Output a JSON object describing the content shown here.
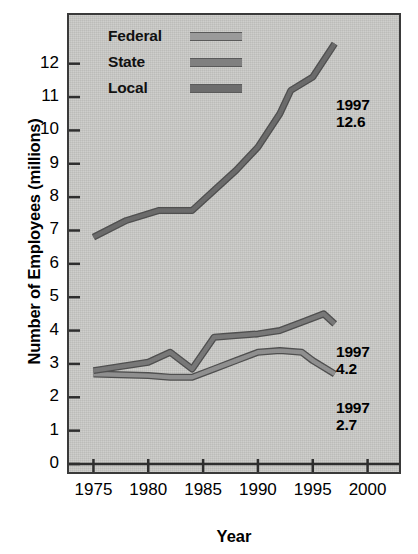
{
  "chart_data": {
    "type": "line",
    "title": "",
    "xlabel": "Year",
    "ylabel": "Number of Employees (millions)",
    "xlim": [
      1973.5,
      2002.5
    ],
    "ylim": [
      0,
      13.1
    ],
    "grid": false,
    "legend_position": "top-left-inside",
    "x_ticks": [
      "1975",
      "1980",
      "1985",
      "1990",
      "1995",
      "2000"
    ],
    "x_tick_values": [
      1975,
      1980,
      1985,
      1990,
      1995,
      2000
    ],
    "y_ticks": [
      "0",
      "1",
      "2",
      "3",
      "4",
      "5",
      "6",
      "7",
      "8",
      "9",
      "10",
      "11",
      "12"
    ],
    "y_tick_values": [
      0,
      1,
      2,
      3,
      4,
      5,
      6,
      7,
      8,
      9,
      10,
      11,
      12
    ],
    "series": [
      {
        "name": "Federal",
        "color": "#8f8f8f",
        "x": [
          1975,
          1980,
          1982,
          1984,
          1986,
          1988,
          1990,
          1992,
          1994,
          1995,
          1997
        ],
        "values": [
          2.7,
          2.65,
          2.6,
          2.6,
          2.85,
          3.1,
          3.35,
          3.4,
          3.35,
          3.1,
          2.7
        ]
      },
      {
        "name": "State",
        "color": "#787878",
        "x": [
          1975,
          1980,
          1982,
          1984,
          1986,
          1988,
          1990,
          1992,
          1994,
          1996,
          1997
        ],
        "values": [
          2.8,
          3.05,
          3.35,
          2.85,
          3.8,
          3.85,
          3.9,
          4.0,
          4.25,
          4.5,
          4.2
        ]
      },
      {
        "name": "Local",
        "color": "#6b6b6b",
        "x": [
          1975,
          1978,
          1981,
          1984,
          1986,
          1988,
          1990,
          1992,
          1993,
          1995,
          1997
        ],
        "values": [
          6.8,
          7.3,
          7.6,
          7.6,
          8.2,
          8.8,
          9.5,
          10.5,
          11.2,
          11.6,
          12.6
        ]
      }
    ],
    "annotations": [
      {
        "id": "local-end",
        "year": "1997",
        "value": "12.6",
        "series": "Local"
      },
      {
        "id": "state-end",
        "year": "1997",
        "value": "4.2",
        "series": "State"
      },
      {
        "id": "federal-end",
        "year": "1997",
        "value": "2.7",
        "series": "Federal"
      }
    ]
  },
  "legend": {
    "items": [
      {
        "label": "Federal",
        "color": "#9a9a9a"
      },
      {
        "label": "State",
        "color": "#808080"
      },
      {
        "label": "Local",
        "color": "#6d6d6d"
      }
    ]
  },
  "axes": {
    "x_title": "Year",
    "y_title": "Number of Employees (millions)"
  },
  "annotations": {
    "local": {
      "year": "1997",
      "value": "12.6"
    },
    "state": {
      "year": "1997",
      "value": "4.2"
    },
    "federal": {
      "year": "1997",
      "value": "2.7"
    }
  },
  "colors": {
    "plot_background": "#c9c9c6",
    "frame": "#3a3a3a",
    "text": "#000000"
  }
}
